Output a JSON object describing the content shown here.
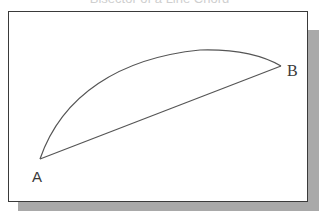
{
  "diagram": {
    "caption_partial": "Bisector of a Line Chord",
    "points": {
      "A": {
        "label": "A",
        "x": 40,
        "y": 159
      },
      "B": {
        "label": "B",
        "x": 281,
        "y": 66
      }
    },
    "arc": {
      "from": "A",
      "to": "B",
      "peak": {
        "x": 205,
        "y": 50
      }
    },
    "chord": {
      "from": "A",
      "to": "B"
    },
    "colors": {
      "stroke": "#555555",
      "frame_border": "#3a3a3a",
      "shadow": "#a9a9a9",
      "background": "#ffffff"
    }
  }
}
